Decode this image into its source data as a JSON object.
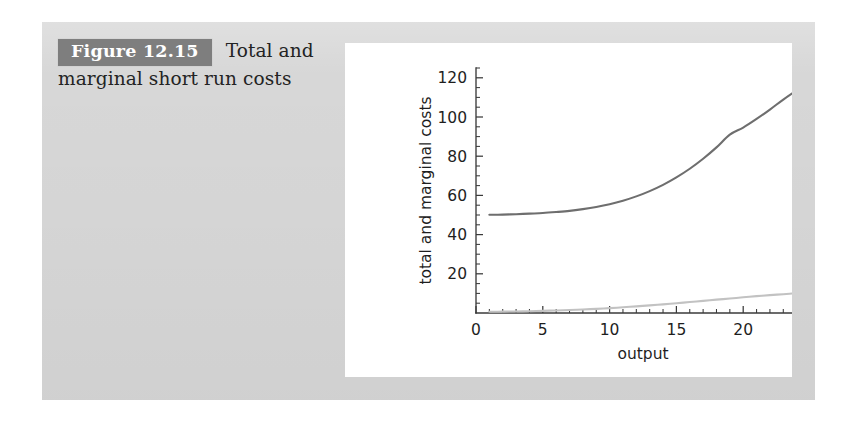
{
  "figure": {
    "badge_label": "Figure 12.15",
    "caption_line1": "Total and",
    "caption_line2": "marginal short run costs",
    "badge_color": "#7e7e7e",
    "panel_color": "#d7d7d7",
    "card_color": "#ffffff"
  },
  "chart_data": {
    "type": "line",
    "title": "",
    "subtitle": "",
    "xlabel": "output",
    "ylabel": "total and marginal costs",
    "xlim": [
      0,
      25
    ],
    "ylim": [
      0,
      125
    ],
    "grid": false,
    "legend_position": "none",
    "x_ticks": [
      0,
      5,
      10,
      15,
      20,
      25
    ],
    "x_tick_labels": [
      "0",
      "5",
      "10",
      "15",
      "20",
      "25"
    ],
    "x_minor_step": 1,
    "y_ticks": [
      20,
      40,
      60,
      80,
      100,
      120
    ],
    "y_tick_labels": [
      "20",
      "40",
      "60",
      "80",
      "100",
      "120"
    ],
    "y_minor_step": 5,
    "x": [
      1,
      2,
      3,
      4,
      5,
      6,
      7,
      8,
      9,
      10,
      11,
      12,
      13,
      14,
      15,
      16,
      17,
      18,
      19,
      20,
      21,
      22,
      23,
      24,
      25
    ],
    "series": [
      {
        "name": "total cost",
        "color": "#6e6e6e",
        "values": [
          50.1,
          50.2,
          50.4,
          50.7,
          51.0,
          51.5,
          52.1,
          53.0,
          54.1,
          55.5,
          57.3,
          59.5,
          62.2,
          65.4,
          69.2,
          73.6,
          78.7,
          84.5,
          91.0,
          94.6,
          99.0,
          103.8,
          108.9,
          113.6,
          118.0
        ]
      },
      {
        "name": "marginal cost",
        "color": "#c2c2c2",
        "values": [
          0.6,
          0.7,
          0.8,
          0.9,
          1.1,
          1.3,
          1.5,
          1.8,
          2.1,
          2.5,
          2.9,
          3.4,
          3.9,
          4.4,
          5.0,
          5.6,
          6.2,
          6.8,
          7.4,
          8.0,
          8.6,
          9.1,
          9.6,
          10.1,
          10.5
        ]
      }
    ]
  }
}
